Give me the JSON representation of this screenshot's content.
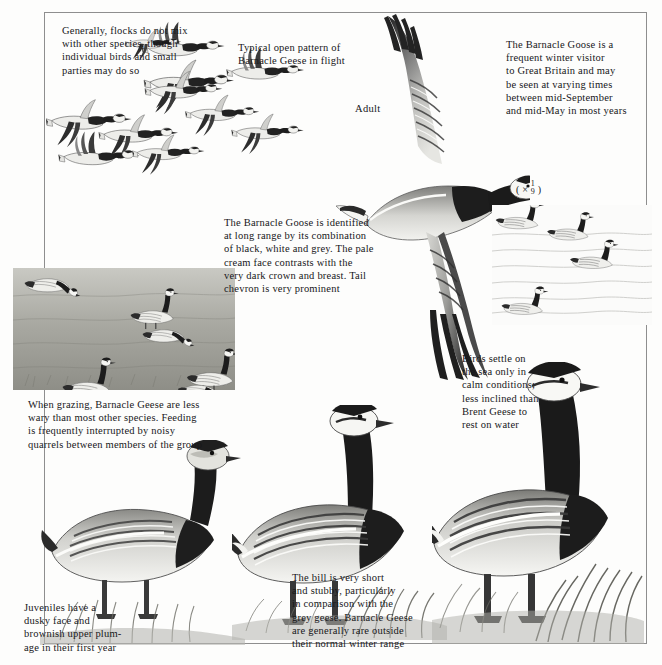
{
  "plate": {
    "subject": "Barnacle Goose",
    "scale_note": {
      "prefix": "( × ",
      "numerator": "1",
      "denominator": "9",
      "suffix": " )"
    },
    "adult_label": "Adult"
  },
  "captions": {
    "flock_mixing": "Generally, flocks do not mix\nwith other species, though\nindividual birds and small\nparties may do so",
    "open_pattern": "Typical open pattern of\nBarnacle Geese in flight",
    "winter_visitor": "The Barnacle Goose is a\nfrequent winter visitor\nto Great Britain and may\nbe seen at varying times\nbetween mid-September\nand mid-May in most years",
    "identification": "The Barnacle Goose is identified\nat long range by its combination\nof black, white and grey. The pale\ncream face contrasts with the\nvery dark crown and breast. Tail\nchevron is very prominent",
    "grazing": "When grazing, Barnacle Geese are less\nwary than most other species. Feeding\nis frequently interrupted by noisy\nquarrels between members of the group",
    "settling_on_sea": "Birds settle on\nthe sea only in\ncalm conditions;\nless inclined than\nBrent Geese to\nrest on water",
    "bill_shape": "The bill is very short\nand stubby, particularly\nin comparison with the\ngrey geese. Barnacle Geese\nare generally rare outside\ntheir normal winter range",
    "juvenile": "Juveniles have a\ndusky face and\nbrownish upper plum-\nage in their first year"
  },
  "illustrations": {
    "flying_flock": "flying-flock-of-barnacle-geese",
    "large_flying_adult": "large-flying-adult-barnacle-goose",
    "swimming_group": "group-of-swimming-barnacle-geese",
    "grazing_flock": "grazing-flock-on-grassland",
    "standing_juvenile": "standing-juvenile-barnacle-goose",
    "standing_adult_centre": "standing-adult-barnacle-goose-centre",
    "standing_adult_right": "standing-adult-barnacle-goose-right"
  },
  "colors": {
    "ink": "#17171a",
    "paper": "#fdfdfc",
    "frame": "#8e8e8e",
    "plumage_dark": "#262626",
    "plumage_grey": "#9a9a9a",
    "plumage_light": "#e8e8e4"
  }
}
